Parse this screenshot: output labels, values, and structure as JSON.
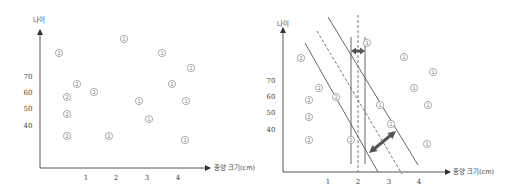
{
  "chart_data": [
    {
      "type": "scatter",
      "title": "",
      "xlabel": "종양 크기(cm)",
      "ylabel": "나이",
      "x_ticks": [
        "1",
        "2",
        "3",
        "4"
      ],
      "y_ticks": [
        "40",
        "50",
        "60",
        "70"
      ],
      "grid": false,
      "legend": null,
      "series": [
        {
          "name": "②",
          "marker": "②",
          "points": [
            {
              "x": 0.3,
              "y": 84
            },
            {
              "x": 0.8,
              "y": 64
            },
            {
              "x": 0.5,
              "y": 57
            },
            {
              "x": 1.2,
              "y": 60
            },
            {
              "x": 0.5,
              "y": 47
            },
            {
              "x": 0.5,
              "y": 33
            },
            {
              "x": 1.8,
              "y": 33
            }
          ]
        },
        {
          "name": "①",
          "marker": "①",
          "points": [
            {
              "x": 2.3,
              "y": 93
            },
            {
              "x": 3.5,
              "y": 84
            },
            {
              "x": 4.4,
              "y": 74
            },
            {
              "x": 3.8,
              "y": 64
            },
            {
              "x": 2.7,
              "y": 54
            },
            {
              "x": 4.2,
              "y": 54
            },
            {
              "x": 3.0,
              "y": 43
            },
            {
              "x": 4.2,
              "y": 30
            }
          ]
        }
      ]
    },
    {
      "type": "scatter",
      "title": "",
      "xlabel": "종양 크기(cm)",
      "ylabel": "나이",
      "x_ticks": [
        "1",
        "2",
        "3",
        "4"
      ],
      "y_ticks": [
        "40",
        "50",
        "60",
        "70"
      ],
      "grid": false,
      "legend": null,
      "annotations": [
        "vertical decision boundary (dashed) near x=2 with two solid vertical margin lines and a small double-headed arrow showing a narrow margin",
        "diagonal decision boundary (dashed) with two parallel solid margin lines and a large double-headed arrow showing a wide margin"
      ],
      "series": [
        {
          "name": "②",
          "marker": "②",
          "points": [
            {
              "x": 0.4,
              "y": 84
            },
            {
              "x": 0.9,
              "y": 64
            },
            {
              "x": 1.3,
              "y": 60
            },
            {
              "x": 0.6,
              "y": 57
            },
            {
              "x": 0.6,
              "y": 47
            },
            {
              "x": 0.6,
              "y": 33
            },
            {
              "x": 1.8,
              "y": 33
            }
          ]
        },
        {
          "name": "①",
          "marker": "①",
          "points": [
            {
              "x": 2.3,
              "y": 93
            },
            {
              "x": 3.4,
              "y": 84
            },
            {
              "x": 4.3,
              "y": 75
            },
            {
              "x": 3.7,
              "y": 64
            },
            {
              "x": 2.7,
              "y": 54
            },
            {
              "x": 4.2,
              "y": 54
            },
            {
              "x": 3.1,
              "y": 43
            },
            {
              "x": 4.2,
              "y": 31
            }
          ]
        }
      ]
    }
  ],
  "left_chart": {
    "ylabel": "나이",
    "xlabel": "종양 크기(cm)",
    "y_ticks": [
      {
        "label": "70",
        "y": 76
      },
      {
        "label": "60",
        "y": 92
      },
      {
        "label": "50",
        "y": 108
      },
      {
        "label": "40",
        "y": 125
      }
    ],
    "x_ticks": [
      {
        "label": "1",
        "x": 86
      },
      {
        "label": "2",
        "x": 116
      },
      {
        "label": "3",
        "x": 147
      },
      {
        "label": "4",
        "x": 178
      }
    ],
    "points": [
      {
        "cls": "②",
        "px": 59,
        "py": 53
      },
      {
        "cls": "②",
        "px": 77,
        "py": 84
      },
      {
        "cls": "②",
        "px": 67,
        "py": 97
      },
      {
        "cls": "②",
        "px": 94,
        "py": 92
      },
      {
        "cls": "②",
        "px": 67,
        "py": 114
      },
      {
        "cls": "②",
        "px": 67,
        "py": 136
      },
      {
        "cls": "②",
        "px": 109,
        "py": 136
      },
      {
        "cls": "①",
        "px": 124,
        "py": 39
      },
      {
        "cls": "①",
        "px": 162,
        "py": 53
      },
      {
        "cls": "①",
        "px": 191,
        "py": 68
      },
      {
        "cls": "①",
        "px": 172,
        "py": 84
      },
      {
        "cls": "①",
        "px": 139,
        "py": 101
      },
      {
        "cls": "①",
        "px": 186,
        "py": 101
      },
      {
        "cls": "①",
        "px": 149,
        "py": 119
      },
      {
        "cls": "①",
        "px": 185,
        "py": 140
      }
    ]
  },
  "right_chart": {
    "ylabel": "나이",
    "xlabel": "종양 크기(cm)",
    "y_ticks": [
      {
        "label": "70",
        "y": 80
      },
      {
        "label": "60",
        "y": 96
      },
      {
        "label": "50",
        "y": 112
      },
      {
        "label": "40",
        "y": 129
      }
    ],
    "x_ticks": [
      {
        "label": "1",
        "x": 328
      },
      {
        "label": "2",
        "x": 358
      },
      {
        "label": "3",
        "x": 389
      },
      {
        "label": "4",
        "x": 419
      }
    ],
    "points": [
      {
        "cls": "②",
        "px": 301,
        "py": 58
      },
      {
        "cls": "②",
        "px": 319,
        "py": 88
      },
      {
        "cls": "②",
        "px": 336,
        "py": 97
      },
      {
        "cls": "②",
        "px": 309,
        "py": 100
      },
      {
        "cls": "②",
        "px": 309,
        "py": 117
      },
      {
        "cls": "②",
        "px": 309,
        "py": 140
      },
      {
        "cls": "②",
        "px": 351,
        "py": 140
      },
      {
        "cls": "①",
        "px": 367,
        "py": 43
      },
      {
        "cls": "①",
        "px": 404,
        "py": 57
      },
      {
        "cls": "①",
        "px": 433,
        "py": 72
      },
      {
        "cls": "①",
        "px": 414,
        "py": 88
      },
      {
        "cls": "①",
        "px": 380,
        "py": 105
      },
      {
        "cls": "①",
        "px": 428,
        "py": 105
      },
      {
        "cls": "①",
        "px": 391,
        "py": 124
      },
      {
        "cls": "①",
        "px": 427,
        "py": 144
      }
    ]
  }
}
